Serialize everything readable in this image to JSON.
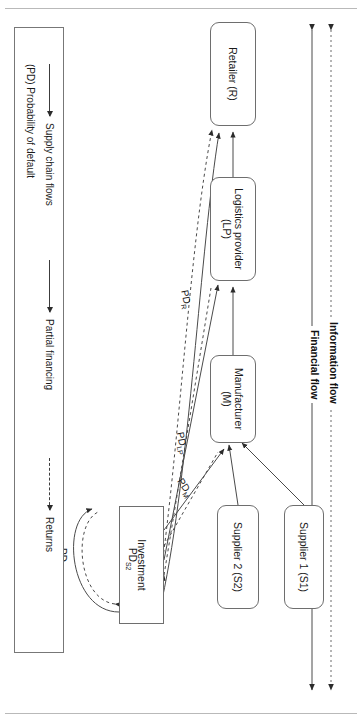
{
  "figure": {
    "type": "supply-chain-finance-flow-diagram",
    "flow_legend": [
      {
        "id": "information-flow",
        "label": "Information flow",
        "style": "dashed"
      },
      {
        "id": "financial-flow",
        "label": "Financial flow",
        "style": "solid"
      }
    ],
    "nodes": [
      {
        "id": "retailer",
        "label": "Retailer (R)",
        "shape": "rounded"
      },
      {
        "id": "logistics",
        "label": "Logistics provider\n(LP)",
        "line1": "Logistics provider",
        "line2": "(LP)",
        "shape": "rounded"
      },
      {
        "id": "manufacturer",
        "label": "Manufacturer\n(M)",
        "line1": "Manufacturer",
        "line2": "(M)",
        "shape": "rounded"
      },
      {
        "id": "supplier1",
        "label": "Supplier 1 (S1)",
        "shape": "rounded"
      },
      {
        "id": "supplier2",
        "label": "Supplier 2 (S2)",
        "shape": "rounded"
      },
      {
        "id": "investment",
        "label": "Investment",
        "shape": "square"
      }
    ],
    "edge_labels": [
      {
        "id": "pd-r",
        "text": "PD",
        "sub": "R"
      },
      {
        "id": "pd-lp",
        "text": "PD",
        "sub": "LP"
      },
      {
        "id": "pd-m",
        "text": "PD",
        "sub": "M"
      },
      {
        "id": "pd-s2",
        "text": "PD",
        "sub": "S2"
      },
      {
        "id": "pd-s1",
        "text": "PD",
        "sub": "S1"
      }
    ],
    "legend": {
      "items": [
        {
          "id": "supply-chain-flows",
          "label": "Supply chain flows",
          "style": "solid",
          "arrow": true
        },
        {
          "id": "probability-default",
          "label": "(PD) Probability of default",
          "style": "none",
          "arrow": false
        },
        {
          "id": "partial-financing",
          "label": "Partial financing",
          "style": "solid",
          "arrow": true
        },
        {
          "id": "returns",
          "label": "Returns",
          "style": "dashed",
          "arrow": true
        }
      ]
    },
    "colors": {
      "node_border": "#6e6e6e",
      "line": "#3c3c3c",
      "text": "#1b1b1b",
      "frame": "#b9b9b9",
      "background": "#ffffff"
    }
  }
}
